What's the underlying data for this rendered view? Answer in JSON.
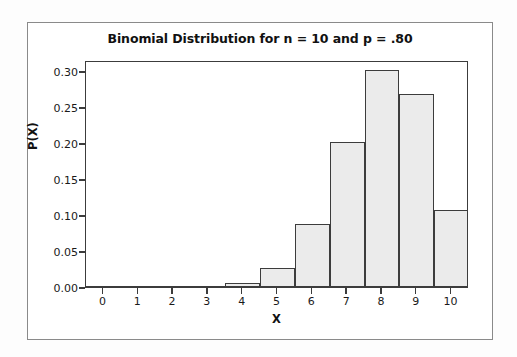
{
  "chart_data": {
    "type": "bar",
    "title": "Binomial Distribution for n = 10 and p = .80",
    "xlabel": "X",
    "ylabel": "P(X)",
    "categories": [
      "0",
      "1",
      "2",
      "3",
      "4",
      "5",
      "6",
      "7",
      "8",
      "9",
      "10"
    ],
    "values": [
      0.0,
      0.0,
      0.0001,
      0.0008,
      0.0055,
      0.0264,
      0.0881,
      0.2013,
      0.302,
      0.2684,
      0.1074
    ],
    "xlim": [
      -0.5,
      10.5
    ],
    "ylim": [
      0,
      0.3152
    ],
    "ytick_labels": [
      "0.00",
      "0.05",
      "0.10",
      "0.15",
      "0.20",
      "0.25",
      "0.30"
    ],
    "ytick_values": [
      0.0,
      0.05,
      0.1,
      0.15,
      0.2,
      0.25,
      0.3
    ],
    "xtick_labels": [
      "0",
      "1",
      "2",
      "3",
      "4",
      "5",
      "6",
      "7",
      "8",
      "9",
      "10"
    ],
    "grid": false,
    "legend": null,
    "bar_fill_color": "#ebebeb",
    "bar_edge_color": "#3c3c3c",
    "axis_color": "#3c3c3c",
    "background_color": "#ffffff",
    "text_color": "#111111"
  }
}
